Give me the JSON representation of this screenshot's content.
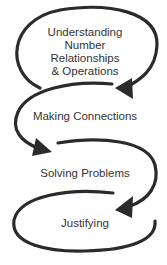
{
  "diagram": {
    "type": "cyclic-flow",
    "stroke_color": "#2b2b2b",
    "text_color": "#333333",
    "steps": [
      {
        "lines": [
          "Understanding",
          "Number",
          "Relationships",
          "& Operations"
        ]
      },
      {
        "lines": [
          "Making Connections"
        ]
      },
      {
        "lines": [
          "Solving Problems"
        ]
      },
      {
        "lines": [
          "Justifying"
        ]
      }
    ],
    "arrows": [
      {
        "from": "Understanding Number Relationships & Operations",
        "to": "Making Connections"
      },
      {
        "from": "Making Connections",
        "to": "Solving Problems"
      },
      {
        "from": "Solving Problems",
        "to": "Justifying"
      }
    ]
  }
}
